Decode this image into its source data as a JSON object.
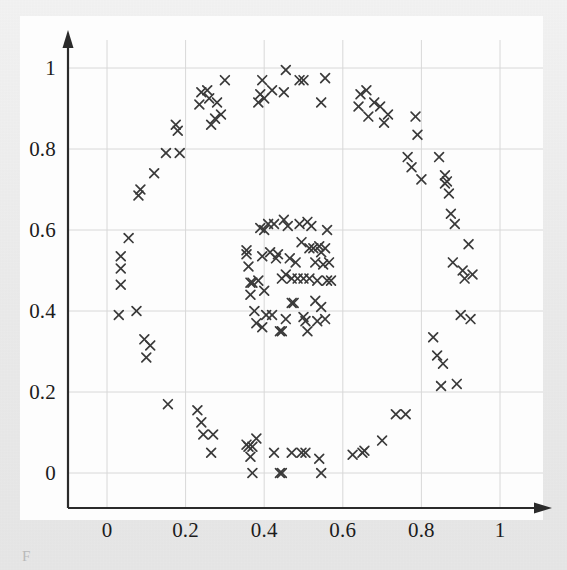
{
  "figure": {
    "kind": "scatter-plot",
    "background_color": "#ededed",
    "canvas_color": "#fdfdfd",
    "axis_color": "#2b2b2b",
    "grid_color": "#d8d8d8",
    "marker_color": "#3a3a3a",
    "marker_symbol": "x",
    "caption_fragment": "F"
  },
  "chart_data": {
    "type": "scatter",
    "title": "",
    "subtitle": "",
    "xlabel": "",
    "ylabel": "",
    "xlim": [
      -0.1,
      1.1
    ],
    "ylim": [
      -0.1,
      1.1
    ],
    "grid": true,
    "legend": null,
    "legend_position": "none",
    "marker": "x",
    "marker_color": "#3a3a3a",
    "xticks": [
      0,
      0.2,
      0.4,
      0.6,
      0.8,
      1
    ],
    "yticks": [
      0,
      0.2,
      0.4,
      0.6,
      0.8,
      1
    ],
    "xtick_labels": [
      "0",
      "0.2",
      "0.4",
      "0.6",
      "0.8",
      "1"
    ],
    "ytick_labels": [
      "0",
      "0.2",
      "0.4",
      "0.6",
      "0.8",
      "1"
    ],
    "annotations": [],
    "series": [
      {
        "name": "outer-ring",
        "marker": "x",
        "color": "#3a3a3a",
        "points": [
          [
            0.035,
            0.535
          ],
          [
            0.035,
            0.505
          ],
          [
            0.035,
            0.465
          ],
          [
            0.03,
            0.39
          ],
          [
            0.055,
            0.58
          ],
          [
            0.075,
            0.4
          ],
          [
            0.085,
            0.7
          ],
          [
            0.08,
            0.685
          ],
          [
            0.095,
            0.33
          ],
          [
            0.1,
            0.285
          ],
          [
            0.11,
            0.315
          ],
          [
            0.12,
            0.74
          ],
          [
            0.15,
            0.79
          ],
          [
            0.155,
            0.17
          ],
          [
            0.175,
            0.86
          ],
          [
            0.18,
            0.845
          ],
          [
            0.185,
            0.79
          ],
          [
            0.23,
            0.155
          ],
          [
            0.235,
            0.91
          ],
          [
            0.24,
            0.125
          ],
          [
            0.24,
            0.94
          ],
          [
            0.245,
            0.095
          ],
          [
            0.255,
            0.945
          ],
          [
            0.26,
            0.925
          ],
          [
            0.265,
            0.86
          ],
          [
            0.265,
            0.05
          ],
          [
            0.27,
            0.095
          ],
          [
            0.275,
            0.875
          ],
          [
            0.28,
            0.915
          ],
          [
            0.29,
            0.885
          ],
          [
            0.3,
            0.97
          ],
          [
            0.355,
            0.07
          ],
          [
            0.36,
            0.065
          ],
          [
            0.365,
            0.04
          ],
          [
            0.37,
            0.065
          ],
          [
            0.37,
            0.0
          ],
          [
            0.38,
            0.085
          ],
          [
            0.385,
            0.915
          ],
          [
            0.39,
            0.935
          ],
          [
            0.395,
            0.97
          ],
          [
            0.4,
            0.925
          ],
          [
            0.42,
            0.945
          ],
          [
            0.425,
            0.05
          ],
          [
            0.44,
            0.0
          ],
          [
            0.445,
            0.0
          ],
          [
            0.45,
            0.94
          ],
          [
            0.455,
            0.995
          ],
          [
            0.47,
            0.05
          ],
          [
            0.49,
            0.97
          ],
          [
            0.495,
            0.05
          ],
          [
            0.5,
            0.97
          ],
          [
            0.505,
            0.05
          ],
          [
            0.54,
            0.035
          ],
          [
            0.545,
            0.0
          ],
          [
            0.545,
            0.915
          ],
          [
            0.555,
            0.975
          ],
          [
            0.625,
            0.045
          ],
          [
            0.64,
            0.905
          ],
          [
            0.645,
            0.935
          ],
          [
            0.65,
            0.05
          ],
          [
            0.655,
            0.055
          ],
          [
            0.66,
            0.945
          ],
          [
            0.665,
            0.88
          ],
          [
            0.68,
            0.915
          ],
          [
            0.695,
            0.905
          ],
          [
            0.7,
            0.08
          ],
          [
            0.705,
            0.865
          ],
          [
            0.715,
            0.885
          ],
          [
            0.735,
            0.145
          ],
          [
            0.76,
            0.145
          ],
          [
            0.765,
            0.78
          ],
          [
            0.775,
            0.755
          ],
          [
            0.785,
            0.88
          ],
          [
            0.79,
            0.835
          ],
          [
            0.8,
            0.725
          ],
          [
            0.83,
            0.335
          ],
          [
            0.84,
            0.29
          ],
          [
            0.845,
            0.78
          ],
          [
            0.85,
            0.215
          ],
          [
            0.855,
            0.27
          ],
          [
            0.86,
            0.735
          ],
          [
            0.86,
            0.715
          ],
          [
            0.865,
            0.72
          ],
          [
            0.87,
            0.69
          ],
          [
            0.875,
            0.64
          ],
          [
            0.88,
            0.52
          ],
          [
            0.885,
            0.615
          ],
          [
            0.89,
            0.22
          ],
          [
            0.9,
            0.39
          ],
          [
            0.905,
            0.5
          ],
          [
            0.91,
            0.48
          ],
          [
            0.92,
            0.565
          ],
          [
            0.925,
            0.38
          ],
          [
            0.93,
            0.49
          ]
        ]
      },
      {
        "name": "inner-blob",
        "marker": "x",
        "color": "#3a3a3a",
        "points": [
          [
            0.355,
            0.55
          ],
          [
            0.355,
            0.54
          ],
          [
            0.36,
            0.51
          ],
          [
            0.365,
            0.44
          ],
          [
            0.365,
            0.47
          ],
          [
            0.37,
            0.47
          ],
          [
            0.375,
            0.4
          ],
          [
            0.38,
            0.37
          ],
          [
            0.385,
            0.475
          ],
          [
            0.39,
            0.605
          ],
          [
            0.395,
            0.36
          ],
          [
            0.395,
            0.535
          ],
          [
            0.4,
            0.6
          ],
          [
            0.4,
            0.45
          ],
          [
            0.405,
            0.39
          ],
          [
            0.41,
            0.615
          ],
          [
            0.415,
            0.545
          ],
          [
            0.42,
            0.39
          ],
          [
            0.425,
            0.615
          ],
          [
            0.43,
            0.53
          ],
          [
            0.435,
            0.54
          ],
          [
            0.44,
            0.35
          ],
          [
            0.445,
            0.35
          ],
          [
            0.445,
            0.48
          ],
          [
            0.45,
            0.625
          ],
          [
            0.455,
            0.38
          ],
          [
            0.455,
            0.49
          ],
          [
            0.46,
            0.61
          ],
          [
            0.465,
            0.53
          ],
          [
            0.47,
            0.48
          ],
          [
            0.47,
            0.42
          ],
          [
            0.475,
            0.42
          ],
          [
            0.48,
            0.52
          ],
          [
            0.485,
            0.48
          ],
          [
            0.49,
            0.615
          ],
          [
            0.495,
            0.57
          ],
          [
            0.5,
            0.385
          ],
          [
            0.5,
            0.48
          ],
          [
            0.505,
            0.375
          ],
          [
            0.51,
            0.62
          ],
          [
            0.51,
            0.35
          ],
          [
            0.515,
            0.48
          ],
          [
            0.515,
            0.555
          ],
          [
            0.52,
            0.61
          ],
          [
            0.525,
            0.555
          ],
          [
            0.53,
            0.425
          ],
          [
            0.53,
            0.52
          ],
          [
            0.535,
            0.375
          ],
          [
            0.535,
            0.475
          ],
          [
            0.54,
            0.56
          ],
          [
            0.545,
            0.41
          ],
          [
            0.545,
            0.545
          ],
          [
            0.55,
            0.515
          ],
          [
            0.555,
            0.555
          ],
          [
            0.555,
            0.38
          ],
          [
            0.56,
            0.475
          ],
          [
            0.56,
            0.6
          ],
          [
            0.565,
            0.52
          ],
          [
            0.57,
            0.475
          ]
        ]
      }
    ]
  }
}
